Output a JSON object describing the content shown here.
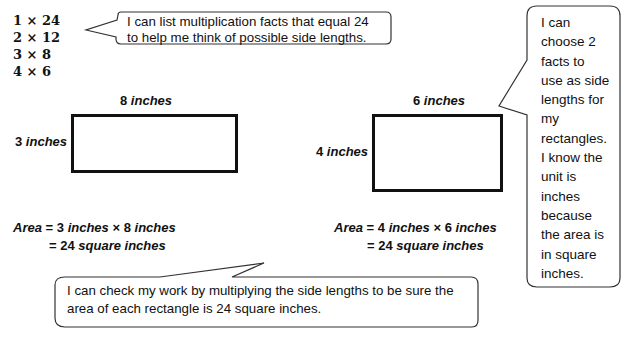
{
  "facts": [
    "1 × 24",
    "2 × 12",
    "3 × 8",
    "4 × 6"
  ],
  "callouts": {
    "top": [
      "I can list multiplication facts that equal 24",
      "to help me think of possible side lengths."
    ],
    "right": [
      "I can",
      "choose 2",
      "facts to",
      "use as side",
      "lengths for",
      "my",
      "rectangles.",
      "I know the",
      "unit is",
      "inches",
      "because",
      "the area is",
      "in square",
      "inches."
    ],
    "bottom": [
      "I can check my work by multiplying the side lengths to be sure the",
      "area of each rectangle is 24 square inches."
    ]
  },
  "rect1": {
    "width_num": "8",
    "height_num": "3",
    "unit": "inches",
    "area_label": "Area",
    "eq_line1_a": "3",
    "eq_line1_b": "8",
    "eq_line2_num": "24",
    "eq_line2_unit": "square inches"
  },
  "rect2": {
    "width_num": "6",
    "height_num": "4",
    "unit": "inches",
    "area_label": "Area",
    "eq_line1_a": "4",
    "eq_line1_b": "6",
    "eq_line2_num": "24",
    "eq_line2_unit": "square inches"
  },
  "symbols": {
    "times": "×",
    "equals": "="
  }
}
